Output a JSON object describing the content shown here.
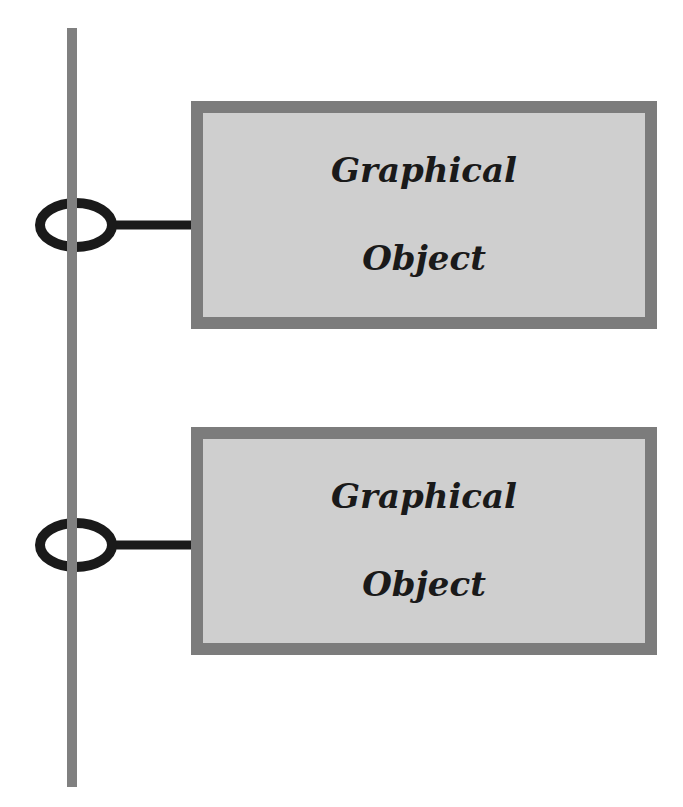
{
  "diagram": {
    "type": "interface-connection",
    "bus": {
      "name": "vertical-bus-line",
      "color": "#808080"
    },
    "connector_color": "#1a1a1a",
    "node_fill": "#cfcfcf",
    "node_border": "#7c7c7c",
    "nodes": [
      {
        "label": "Graphical\nObject",
        "line1": "Graphical",
        "line2": "Object"
      },
      {
        "label": "Graphical\nObject",
        "line1": "Graphical",
        "line2": "Object"
      }
    ]
  }
}
